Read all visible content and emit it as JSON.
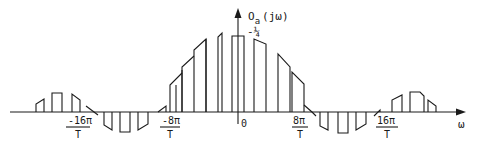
{
  "diagram": {
    "title": "",
    "y_axis_label_main": "O",
    "y_axis_label_sub": "a",
    "y_axis_label_arg": "(jω)",
    "peak_label": "-¼",
    "x_axis_label": "ω",
    "origin_label": "0",
    "ticks": [
      {
        "num": "-16π",
        "den": "T",
        "x": 78
      },
      {
        "num": "-8π",
        "den": "T",
        "x": 172
      },
      {
        "num": "8π",
        "den": "T",
        "x": 300
      },
      {
        "num": "16π",
        "den": "T",
        "x": 388
      }
    ]
  },
  "geometry": {
    "baseline_y": 112,
    "axis_x": 238,
    "axis_top_y": 10,
    "x_axis_start": 10,
    "x_axis_end": 460
  },
  "colors": {
    "ink": "#1a1a1a",
    "background": "#ffffff"
  }
}
